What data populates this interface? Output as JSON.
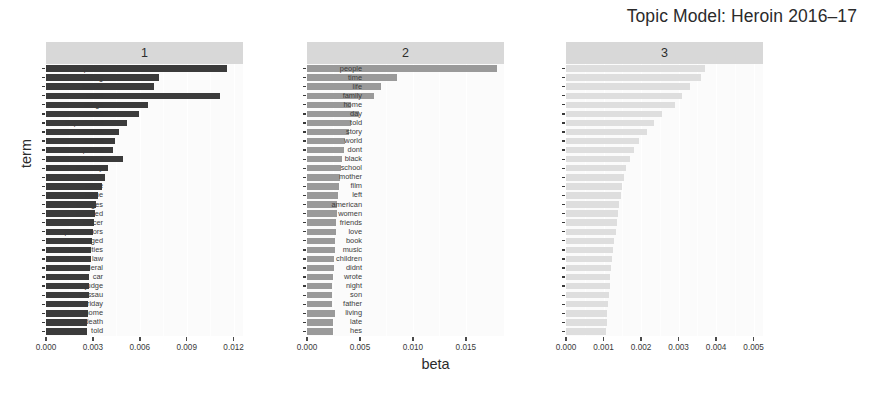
{
  "title": "Topic Model: Heroin 2016–17",
  "axis_titles": {
    "x": "beta",
    "y": "term"
  },
  "colors": {
    "topic1_bar": "#3b3b3b",
    "topic2_bar": "#9a9a9a",
    "topic3_bar": "#dedede",
    "panel_background": "#fbfbfb",
    "strip_background": "#d8d8d8",
    "gridline": "#ffffff",
    "text": "#2b2b2b"
  },
  "chart_data": {
    "type": "bar",
    "title": "Topic Model: Heroin 2016–17",
    "xlabel": "beta",
    "ylabel": "term",
    "orientation": "horizontal",
    "facets": [
      {
        "label": "1",
        "xlim": [
          0.0,
          0.0126
        ],
        "xticks": [
          0.0,
          0.003,
          0.006,
          0.009,
          0.012
        ],
        "xticklabels": [
          "0.000",
          "0.003",
          "0.006",
          "0.009",
          "0.012"
        ],
        "categories": [
          "drug",
          "opioid",
          "heroin",
          "people",
          "addiction",
          "treatment",
          "health",
          "trump",
          "percent",
          "drugs",
          "marijuana",
          "medical",
          "deaths",
          "overdose",
          "patients",
          "opioids",
          "care",
          "president",
          "pain",
          "epidemic",
          "abuse",
          "public",
          "overdoses",
          "prescription",
          "national",
          "program",
          "fentanyl",
          "law",
          "federal",
          "million"
        ],
        "values": [
          0.01155,
          0.00725,
          0.0069,
          0.0111,
          0.0065,
          0.00595,
          0.00515,
          0.0047,
          0.0044,
          0.0043,
          0.0049,
          0.00395,
          0.0038,
          0.00355,
          0.0033,
          0.0032,
          0.00315,
          0.00305,
          0.003,
          0.00295,
          0.0029,
          0.00285,
          0.0028,
          0.00278,
          0.00275,
          0.00272,
          0.0027,
          0.00268,
          0.00265,
          0.00262
        ]
      },
      {
        "label": "2",
        "xlim": [
          0.0,
          0.0186
        ],
        "xticks": [
          0.0,
          0.005,
          0.01,
          0.015
        ],
        "xticklabels": [
          "0.000",
          "0.005",
          "0.010",
          "0.015"
        ],
        "categories": [
          "police",
          "drug",
          "heroin",
          "court",
          "drugs",
          "officers",
          "department",
          "officials",
          "found",
          "prison",
          "district",
          "attorney",
          "criminal",
          "office",
          "crime",
          "charges",
          "arrested",
          "officer",
          "prosecutors",
          "charged",
          "authorities",
          "law",
          "federal",
          "car",
          "judge",
          "nassau",
          "friday",
          "home",
          "death",
          "told"
        ],
        "values": [
          0.0179,
          0.0085,
          0.007,
          0.0063,
          0.0042,
          0.0049,
          0.0042,
          0.00395,
          0.0036,
          0.0035,
          0.0033,
          0.0032,
          0.0031,
          0.003,
          0.0029,
          0.00285,
          0.0028,
          0.00275,
          0.00272,
          0.00268,
          0.00265,
          0.00258,
          0.00255,
          0.0025,
          0.0024,
          0.00238,
          0.00235,
          0.00265,
          0.0025,
          0.00248
        ]
      },
      {
        "label": "3",
        "xlim": [
          0.0,
          0.00525
        ],
        "xticks": [
          0.0,
          0.001,
          0.002,
          0.003,
          0.004,
          0.005
        ],
        "xticklabels": [
          "0.000",
          "0.001",
          "0.002",
          "0.003",
          "0.004",
          "0.005"
        ],
        "categories": [
          "people",
          "time",
          "life",
          "family",
          "home",
          "day",
          "told",
          "story",
          "world",
          "dont",
          "black",
          "school",
          "mother",
          "film",
          "left",
          "american",
          "women",
          "friends",
          "love",
          "book",
          "music",
          "children",
          "didnt",
          "wrote",
          "night",
          "son",
          "father",
          "living",
          "late",
          "hes"
        ],
        "values": [
          0.0037,
          0.0036,
          0.0033,
          0.0031,
          0.0029,
          0.00255,
          0.00235,
          0.00215,
          0.00195,
          0.0018,
          0.0017,
          0.0016,
          0.00155,
          0.0015,
          0.00146,
          0.00142,
          0.00138,
          0.00135,
          0.00132,
          0.00129,
          0.00126,
          0.00123,
          0.0012,
          0.00118,
          0.00116,
          0.00114,
          0.00112,
          0.0011,
          0.00108,
          0.00106
        ]
      }
    ]
  }
}
